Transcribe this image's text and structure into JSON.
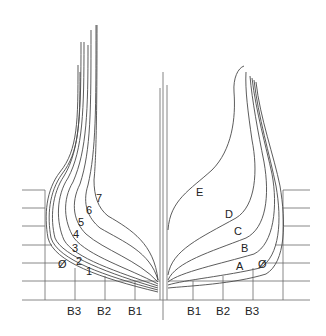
{
  "diagram": {
    "type": "ship-body-plan",
    "left_half": {
      "description": "aft sections",
      "station_labels": [
        "Ø",
        "1",
        "2",
        "3",
        "4",
        "5",
        "6",
        "7"
      ]
    },
    "right_half": {
      "description": "forward sections",
      "station_labels": [
        "Ø",
        "A",
        "B",
        "C",
        "D",
        "E"
      ]
    },
    "buttock_labels_left": [
      "B3",
      "B2",
      "B1"
    ],
    "buttock_labels_right": [
      "B1",
      "B2",
      "B3"
    ],
    "labels": {
      "L0": "Ø",
      "L1": "1",
      "L2": "2",
      "L3": "3",
      "L4": "4",
      "L5": "5",
      "L6": "6",
      "L7": "7",
      "R0": "Ø",
      "RA": "A",
      "RB": "B",
      "RC": "C",
      "RD": "D",
      "RE": "E",
      "bl3": "B3",
      "bl2": "B2",
      "bl1": "B1",
      "br1": "B1",
      "br2": "B2",
      "br3": "B3"
    },
    "colors": {
      "line": "#4a4a4a",
      "grid": "#6a6a6a",
      "background": "#ffffff"
    }
  }
}
